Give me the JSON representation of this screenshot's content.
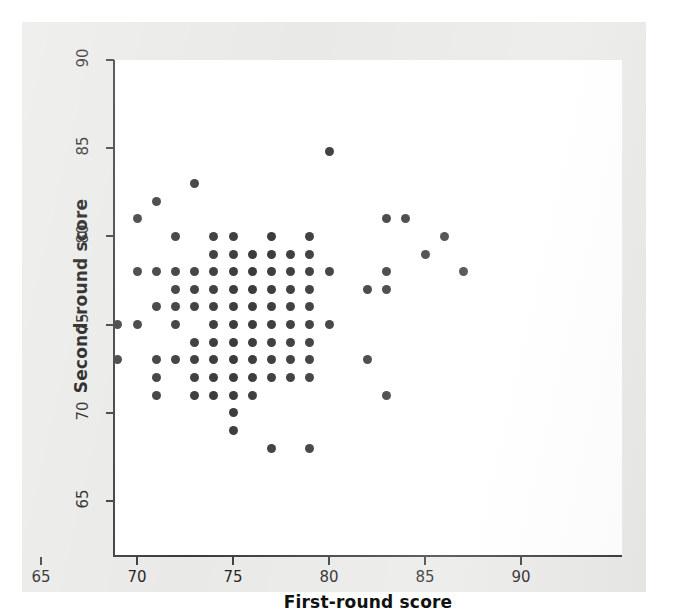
{
  "figure": {
    "background_color": "#e9e9e7",
    "plot_background_color": "#ffffff",
    "axis_color": "#3a3a3a",
    "marker_color": "#3b3b3b"
  },
  "chart_data": {
    "type": "scatter",
    "title": "",
    "xlabel": "First-round score",
    "ylabel": "Second-round score",
    "xlim": [
      64,
      91.5
    ],
    "ylim": [
      63.8,
      91.5
    ],
    "xticks": [
      65,
      70,
      75,
      80,
      85,
      90
    ],
    "yticks": [
      65,
      70,
      75,
      80,
      85,
      90
    ],
    "xtick_labels": [
      "65",
      "70",
      "75",
      "80",
      "85",
      "90"
    ],
    "ytick_labels": [
      "65",
      "70",
      "75",
      "80",
      "85",
      "90"
    ],
    "grid": false,
    "legend": null,
    "marker": "circle",
    "marker_size": 9,
    "n_points": 94,
    "points": [
      [
        69,
        75
      ],
      [
        69,
        73
      ],
      [
        70,
        78
      ],
      [
        70,
        75
      ],
      [
        70,
        81
      ],
      [
        71,
        82
      ],
      [
        71,
        78
      ],
      [
        71,
        76
      ],
      [
        71,
        73
      ],
      [
        71,
        72
      ],
      [
        71,
        71
      ],
      [
        72,
        80
      ],
      [
        72,
        77
      ],
      [
        72,
        76
      ],
      [
        72,
        75
      ],
      [
        73,
        83
      ],
      [
        73,
        77
      ],
      [
        73,
        76
      ],
      [
        73,
        74
      ],
      [
        73,
        71
      ],
      [
        74,
        79
      ],
      [
        74,
        78
      ],
      [
        74,
        77
      ],
      [
        74,
        76
      ],
      [
        74,
        75
      ],
      [
        74,
        74
      ],
      [
        74,
        73
      ],
      [
        74,
        71
      ],
      [
        75,
        80
      ],
      [
        75,
        78
      ],
      [
        75,
        77
      ],
      [
        75,
        76
      ],
      [
        75,
        75
      ],
      [
        75,
        74
      ],
      [
        75,
        73
      ],
      [
        75,
        72
      ],
      [
        75,
        71
      ],
      [
        75,
        70
      ],
      [
        75,
        69
      ],
      [
        76,
        78
      ],
      [
        76,
        77
      ],
      [
        76,
        76
      ],
      [
        76,
        75
      ],
      [
        76,
        74
      ],
      [
        76,
        73
      ],
      [
        76,
        71
      ],
      [
        77,
        80
      ],
      [
        77,
        79
      ],
      [
        77,
        78
      ],
      [
        77,
        77
      ],
      [
        77,
        76
      ],
      [
        77,
        75
      ],
      [
        77,
        74
      ],
      [
        77,
        73
      ],
      [
        77,
        68
      ],
      [
        78,
        79
      ],
      [
        78,
        78
      ],
      [
        78,
        77
      ],
      [
        78,
        76
      ],
      [
        78,
        75
      ],
      [
        78,
        74
      ],
      [
        79,
        80
      ],
      [
        79,
        79
      ],
      [
        79,
        78
      ],
      [
        79,
        77
      ],
      [
        79,
        75
      ],
      [
        79,
        72
      ],
      [
        79,
        68
      ],
      [
        80,
        84.8
      ],
      [
        80,
        78
      ],
      [
        80,
        75
      ],
      [
        82,
        77
      ],
      [
        82,
        73
      ],
      [
        83,
        81
      ],
      [
        83,
        78
      ],
      [
        83,
        77
      ],
      [
        83,
        71
      ],
      [
        84,
        81
      ],
      [
        85,
        79
      ],
      [
        86,
        80
      ],
      [
        87,
        78
      ],
      [
        72,
        78
      ],
      [
        73,
        78
      ],
      [
        74,
        80
      ],
      [
        76,
        79
      ],
      [
        75,
        79
      ],
      [
        72,
        73
      ],
      [
        73,
        73
      ],
      [
        76,
        72
      ],
      [
        74,
        72
      ],
      [
        73,
        72
      ],
      [
        77,
        72
      ],
      [
        78,
        73
      ],
      [
        79,
        73
      ],
      [
        79,
        74
      ],
      [
        78,
        72
      ],
      [
        79,
        76
      ]
    ]
  },
  "axes": {
    "y_title": "Second-round score",
    "x_title": "First-round score"
  }
}
